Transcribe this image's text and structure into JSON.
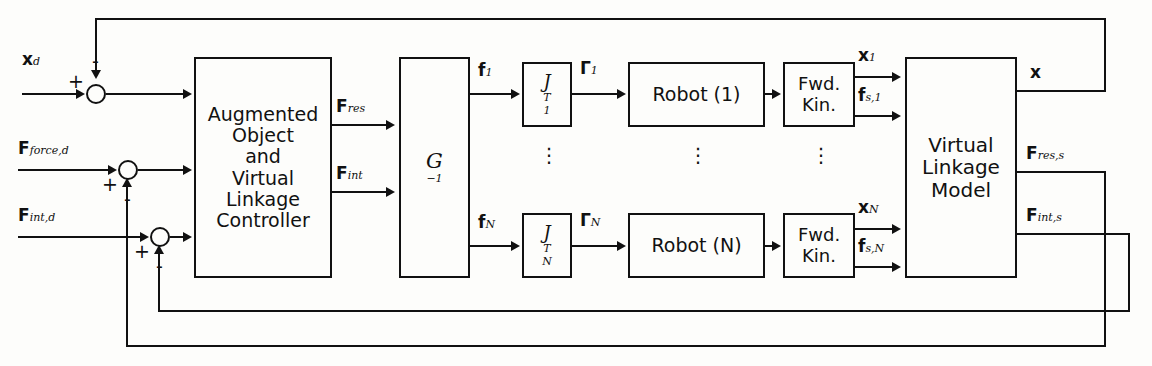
{
  "diagram": {
    "type": "control-block-diagram",
    "line_color": "#111111",
    "background": "#fdfdfb"
  },
  "inputs": [
    {
      "id": "xd",
      "label_html": "<b>x</b><span class='sub'>d</span>",
      "text": "x_d"
    },
    {
      "id": "fforced",
      "label_html": "<b>F</b><span class='sub'>force,d</span>",
      "text": "F_force,d"
    },
    {
      "id": "fintd",
      "label_html": "<b>F</b><span class='sub'>int,d</span>",
      "text": "F_int,d"
    }
  ],
  "junctions": [
    {
      "id": "sum1",
      "in_sign": "+",
      "feedback_sign": "-",
      "feedback_from": "x"
    },
    {
      "id": "sum2",
      "in_sign": "+",
      "feedback_sign": "-",
      "feedback_from": "F_res,s"
    },
    {
      "id": "sum3",
      "in_sign": "+",
      "feedback_sign": "-",
      "feedback_from": "F_int,s"
    }
  ],
  "blocks": {
    "controller": {
      "name": "Augmented Object and Virtual Linkage Controller",
      "lines": [
        "Augmented",
        "Object",
        "and",
        "Virtual",
        "Linkage",
        "Controller"
      ]
    },
    "ginv": {
      "name": "G inverse",
      "label_html": "G<span class='supT'>&#8722;1</span>",
      "text": "G^-1"
    },
    "j1": {
      "name": "Jacobian transpose 1",
      "label_html": "J<span class='supT'>T</span><span class='sub'>1</span>",
      "text": "J_1^T"
    },
    "jn": {
      "name": "Jacobian transpose N",
      "label_html": "J<span class='supT'>T</span><span class='sub'>N</span>",
      "text": "J_N^T"
    },
    "robot1": {
      "name": "Robot 1",
      "text": "Robot (1)"
    },
    "robotn": {
      "name": "Robot N",
      "text": "Robot (N)"
    },
    "fwd1": {
      "name": "Forward Kinematics 1",
      "lines": [
        "Fwd.",
        "Kin."
      ]
    },
    "fwdn": {
      "name": "Forward Kinematics N",
      "lines": [
        "Fwd.",
        "Kin."
      ]
    },
    "vlm": {
      "name": "Virtual Linkage Model",
      "lines": [
        "Virtual",
        "Linkage",
        "Model"
      ]
    }
  },
  "signals": {
    "fres": {
      "label_html": "<b>F</b><span class='sub'>res</span>",
      "text": "F_res"
    },
    "fint": {
      "label_html": "<b>F</b><span class='sub'>int</span>",
      "text": "F_int"
    },
    "f1": {
      "label_html": "<b>f</b><span class='sub'>1</span>",
      "text": "f_1"
    },
    "fN": {
      "label_html": "<b>f</b><span class='sub'>N</span>",
      "text": "f_N"
    },
    "gam1": {
      "label_html": "<b>&#915;</b><span class='sub'>1</span>",
      "text": "Gamma_1"
    },
    "gamN": {
      "label_html": "<b>&#915;</b><span class='sub'>N</span>",
      "text": "Gamma_N"
    },
    "x1": {
      "label_html": "<b>x</b><span class='sub'>1</span>",
      "text": "x_1"
    },
    "fs1": {
      "label_html": "<b>f</b><span class='sub'>s,1</span>",
      "text": "f_s,1"
    },
    "xN": {
      "label_html": "<b>x</b><span class='sub'>N</span>",
      "text": "x_N"
    },
    "fsN": {
      "label_html": "<b>f</b><span class='sub'>s,N</span>",
      "text": "f_s,N"
    },
    "x": {
      "label_html": "<b>x</b>",
      "text": "x"
    },
    "fress": {
      "label_html": "<b>F</b><span class='sub'>res,s</span>",
      "text": "F_res,s"
    },
    "fints": {
      "label_html": "<b>F</b><span class='sub'>int,s</span>",
      "text": "F_int,s"
    }
  },
  "ellipsis": {
    "glyph": "⋮",
    "meaning": "repeated parallel channels from 1 to N"
  }
}
